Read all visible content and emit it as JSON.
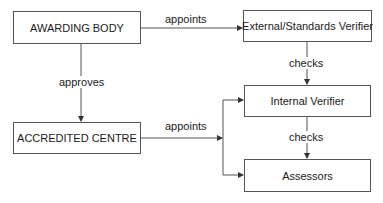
{
  "diagram": {
    "nodes": {
      "awarding_body": "AWARDING BODY",
      "external_verifier": "External/Standards Verifier",
      "accredited_centre": "ACCREDITED CENTRE",
      "internal_verifier": "Internal Verifier",
      "assessors": "Assessors"
    },
    "edges": {
      "awarding_to_external": "appoints",
      "awarding_to_centre": "approves",
      "external_to_internal": "checks",
      "centre_to_staff": "appoints",
      "internal_to_assessors": "checks"
    },
    "colors": {
      "line": "#555555",
      "text": "#1a1a1a",
      "background": "#ffffff"
    }
  }
}
